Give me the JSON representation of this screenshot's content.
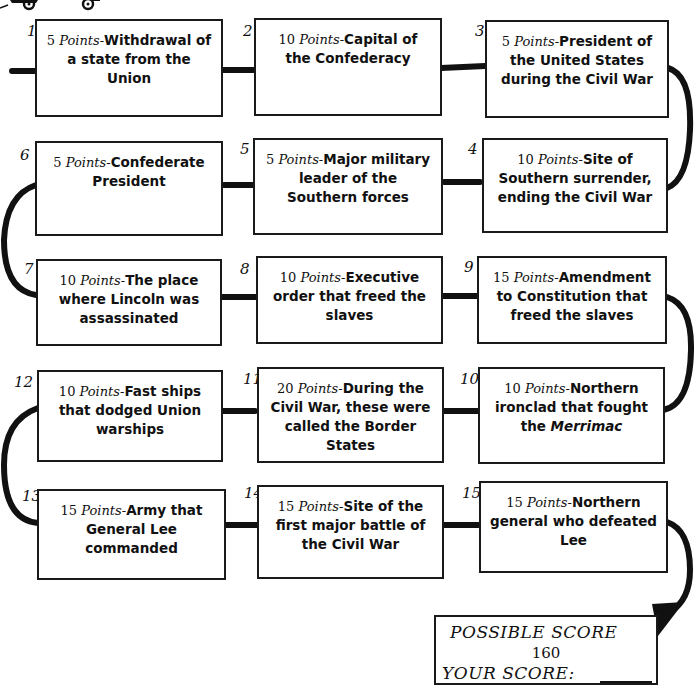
{
  "diagram": {
    "type": "numbered-path-quiz",
    "points_word": "Points",
    "boxes": [
      {
        "number": "1",
        "points": "5",
        "question": "Withdrawal of a state from the Union"
      },
      {
        "number": "2",
        "points": "10",
        "question": "Capital of the Confederacy"
      },
      {
        "number": "3",
        "points": "5",
        "question": "President of the United States during the Civil War"
      },
      {
        "number": "4",
        "points": "10",
        "question": "Site of Southern surrender, ending the Civil War"
      },
      {
        "number": "5",
        "points": "5",
        "question": "Major military leader of the Southern forces"
      },
      {
        "number": "6",
        "points": "5",
        "question": "Confederate President"
      },
      {
        "number": "7",
        "points": "10",
        "question": "The place where Lincoln was assassinated"
      },
      {
        "number": "8",
        "points": "10",
        "question": "Executive order that freed the slaves"
      },
      {
        "number": "9",
        "points": "15",
        "question": "Amendment to Constitution that freed the slaves"
      },
      {
        "number": "10",
        "points": "10",
        "question_pre": "Northern ironclad that fought the ",
        "question_em": "Merrimac"
      },
      {
        "number": "11",
        "points": "20",
        "question": "During the Civil War, these were called the Border States"
      },
      {
        "number": "12",
        "points": "10",
        "question": "Fast ships that dodged Union warships"
      },
      {
        "number": "13",
        "points": "15",
        "question": "Army that General Lee commanded"
      },
      {
        "number": "14",
        "points": "15",
        "question": "Site of the first major battle of the Civil War"
      },
      {
        "number": "15",
        "points": "15",
        "question": "Northern general who defeated Lee"
      }
    ],
    "score": {
      "possible_label": "POSSIBLE SCORE",
      "possible_value": "160",
      "your_label": "YOUR SCORE:",
      "your_value": ""
    },
    "colors": {
      "ink": "#1a1a1a",
      "background": "#ffffff"
    }
  }
}
